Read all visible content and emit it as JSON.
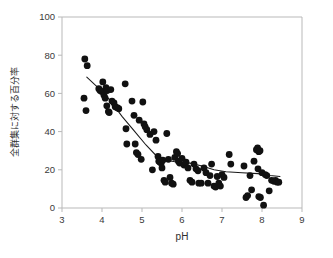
{
  "chart_data": {
    "type": "scatter",
    "title": "",
    "xlabel": "pH",
    "ylabel": "全群集に対する百分率",
    "xlim": [
      3,
      9
    ],
    "ylim": [
      0,
      100
    ],
    "xticks": [
      3,
      4,
      5,
      6,
      7,
      8,
      9
    ],
    "yticks": [
      0,
      20,
      40,
      60,
      80,
      100
    ],
    "grid": false,
    "legend": null,
    "marker": {
      "shape": "circle",
      "color": "#111111",
      "size": 3.4
    },
    "series": [
      {
        "name": "全群集に対する百分率",
        "points": [
          [
            3.57,
            78.0
          ],
          [
            3.63,
            74.5
          ],
          [
            3.55,
            57.5
          ],
          [
            3.6,
            51.0
          ],
          [
            3.92,
            62.5
          ],
          [
            3.95,
            61.5
          ],
          [
            3.99,
            61.0
          ],
          [
            4.02,
            66.0
          ],
          [
            4.05,
            59.0
          ],
          [
            4.08,
            57.5
          ],
          [
            4.1,
            63.0
          ],
          [
            4.13,
            61.5
          ],
          [
            4.12,
            53.5
          ],
          [
            4.16,
            50.5
          ],
          [
            4.18,
            50.0
          ],
          [
            4.22,
            62.0
          ],
          [
            4.25,
            56.0
          ],
          [
            4.3,
            55.0
          ],
          [
            4.33,
            53.0
          ],
          [
            4.38,
            52.5
          ],
          [
            4.42,
            52.0
          ],
          [
            4.58,
            65.0
          ],
          [
            4.6,
            41.5
          ],
          [
            4.62,
            33.5
          ],
          [
            4.75,
            56.0
          ],
          [
            4.8,
            48.5
          ],
          [
            4.83,
            33.5
          ],
          [
            4.86,
            29.0
          ],
          [
            4.9,
            28.0
          ],
          [
            4.93,
            46.0
          ],
          [
            4.98,
            25.5
          ],
          [
            5.02,
            55.5
          ],
          [
            5.05,
            44.0
          ],
          [
            5.08,
            42.5
          ],
          [
            5.12,
            41.0
          ],
          [
            5.2,
            38.5
          ],
          [
            5.26,
            20.0
          ],
          [
            5.3,
            40.0
          ],
          [
            5.35,
            35.5
          ],
          [
            5.4,
            27.0
          ],
          [
            5.42,
            24.5
          ],
          [
            5.45,
            24.0
          ],
          [
            5.48,
            23.5
          ],
          [
            5.5,
            21.0
          ],
          [
            5.52,
            25.0
          ],
          [
            5.55,
            14.5
          ],
          [
            5.58,
            13.5
          ],
          [
            5.62,
            39.0
          ],
          [
            5.66,
            25.5
          ],
          [
            5.7,
            16.0
          ],
          [
            5.74,
            13.0
          ],
          [
            5.78,
            12.5
          ],
          [
            5.82,
            26.5
          ],
          [
            5.86,
            29.5
          ],
          [
            5.89,
            28.5
          ],
          [
            5.91,
            24.5
          ],
          [
            5.94,
            23.5
          ],
          [
            6.0,
            26.0
          ],
          [
            6.05,
            22.5
          ],
          [
            6.1,
            24.0
          ],
          [
            6.15,
            21.0
          ],
          [
            6.2,
            14.5
          ],
          [
            6.25,
            13.5
          ],
          [
            6.3,
            23.0
          ],
          [
            6.35,
            20.5
          ],
          [
            6.4,
            19.5
          ],
          [
            6.42,
            13.0
          ],
          [
            6.48,
            13.0
          ],
          [
            6.55,
            21.0
          ],
          [
            6.6,
            18.5
          ],
          [
            6.65,
            13.0
          ],
          [
            6.7,
            17.0
          ],
          [
            6.74,
            23.0
          ],
          [
            6.8,
            11.5
          ],
          [
            6.84,
            11.0
          ],
          [
            6.88,
            16.5
          ],
          [
            6.92,
            13.0
          ],
          [
            6.96,
            11.5
          ],
          [
            7.0,
            17.5
          ],
          [
            7.05,
            16.0
          ],
          [
            7.18,
            28.0
          ],
          [
            7.22,
            23.0
          ],
          [
            7.55,
            22.0
          ],
          [
            7.6,
            5.5
          ],
          [
            7.64,
            6.5
          ],
          [
            7.7,
            17.0
          ],
          [
            7.74,
            9.5
          ],
          [
            7.8,
            24.5
          ],
          [
            7.86,
            30.5
          ],
          [
            7.89,
            31.5
          ],
          [
            7.92,
            29.5
          ],
          [
            7.95,
            30.0
          ],
          [
            7.9,
            20.5
          ],
          [
            7.92,
            6.0
          ],
          [
            7.96,
            5.5
          ],
          [
            8.0,
            18.5
          ],
          [
            8.04,
            1.5
          ],
          [
            8.08,
            17.5
          ],
          [
            8.12,
            17.0
          ],
          [
            8.18,
            9.0
          ],
          [
            8.24,
            14.5
          ],
          [
            8.3,
            14.0
          ],
          [
            8.34,
            14.5
          ],
          [
            8.38,
            13.5
          ],
          [
            8.42,
            13.5
          ]
        ]
      }
    ],
    "trend_line": {
      "type": "fitted-curve",
      "description": "declining fitted trend from pH 3.6 to pH 8.4",
      "points": [
        [
          3.62,
          68.5
        ],
        [
          3.9,
          63.0
        ],
        [
          4.2,
          56.5
        ],
        [
          4.5,
          48.0
        ],
        [
          4.8,
          40.5
        ],
        [
          5.1,
          33.0
        ],
        [
          5.35,
          27.5
        ],
        [
          5.6,
          25.0
        ],
        [
          5.9,
          24.0
        ],
        [
          6.2,
          23.5
        ],
        [
          6.5,
          22.0
        ],
        [
          6.8,
          20.0
        ],
        [
          7.1,
          19.0
        ],
        [
          7.5,
          18.5
        ],
        [
          7.9,
          18.0
        ],
        [
          8.2,
          17.0
        ],
        [
          8.45,
          16.5
        ]
      ]
    }
  },
  "axes": {
    "x_title": "pH",
    "y_title": "全群集に対する百分率",
    "x_tick_labels": [
      "3",
      "4",
      "5",
      "6",
      "7",
      "8",
      "9"
    ],
    "y_tick_labels": [
      "0",
      "20",
      "40",
      "60",
      "80",
      "100"
    ]
  },
  "colors": {
    "point": "#111111",
    "frame": "#b9b9b9",
    "trend": "#1a1a1a",
    "text": "#2e2e2e",
    "background": "#ffffff"
  }
}
